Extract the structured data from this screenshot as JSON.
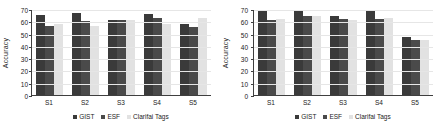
{
  "chart_data": [
    {
      "type": "bar",
      "panel": "left",
      "title": "",
      "xlabel": "",
      "ylabel": "Accuracy",
      "categories": [
        "S1",
        "S2",
        "S3",
        "S4",
        "S5"
      ],
      "ylim": [
        0,
        70
      ],
      "yticks": [
        0,
        10,
        20,
        30,
        40,
        50,
        60,
        70
      ],
      "grid": true,
      "legend_position": "bottom-center",
      "series": [
        {
          "name": "GIST",
          "color": "#3a3a3a",
          "values": [
            65,
            67,
            61,
            66,
            58
          ]
        },
        {
          "name": "ESF",
          "color": "#4a4a4a",
          "values": [
            56,
            60,
            61,
            63,
            55
          ]
        },
        {
          "name": "Clarifai Tags",
          "color": "#e2e2e2",
          "values": [
            58,
            56,
            61,
            58,
            63
          ]
        }
      ]
    },
    {
      "type": "bar",
      "panel": "right",
      "title": "",
      "xlabel": "",
      "ylabel": "Accuracy",
      "categories": [
        "S1",
        "S2",
        "S3",
        "S4",
        "S5"
      ],
      "ylim": [
        0,
        70
      ],
      "yticks": [
        0,
        10,
        20,
        30,
        40,
        50,
        60,
        70
      ],
      "grid": true,
      "legend_position": "bottom-center",
      "series": [
        {
          "name": "GIST",
          "color": "#3a3a3a",
          "values": [
            69,
            68,
            64,
            68,
            47
          ]
        },
        {
          "name": "ESF",
          "color": "#4a4a4a",
          "values": [
            61,
            64,
            62,
            62,
            45
          ]
        },
        {
          "name": "Clarifai Tags",
          "color": "#e2e2e2",
          "values": [
            62,
            64,
            61,
            63,
            45
          ]
        }
      ]
    }
  ],
  "left_panel": {
    "ylabel": "Accuracy",
    "ytick_labels": [
      "70",
      "60",
      "50",
      "40",
      "30",
      "20",
      "10",
      "0"
    ],
    "xtick_labels": [
      "S1",
      "S2",
      "S3",
      "S4",
      "S5"
    ],
    "legend": [
      {
        "label": "GIST",
        "color": "#3a3a3a"
      },
      {
        "label": "ESF",
        "color": "#4a4a4a"
      },
      {
        "label": "Clarifai Tags",
        "color": "#e2e2e2"
      }
    ]
  },
  "right_panel": {
    "ylabel": "Accuracy",
    "ytick_labels": [
      "70",
      "60",
      "50",
      "40",
      "30",
      "20",
      "10",
      "0"
    ],
    "xtick_labels": [
      "S1",
      "S2",
      "S3",
      "S4",
      "S5"
    ],
    "legend": [
      {
        "label": "GIST",
        "color": "#3a3a3a"
      },
      {
        "label": "ESF",
        "color": "#4a4a4a"
      },
      {
        "label": "Clarifai Tags",
        "color": "#e2e2e2"
      }
    ]
  }
}
